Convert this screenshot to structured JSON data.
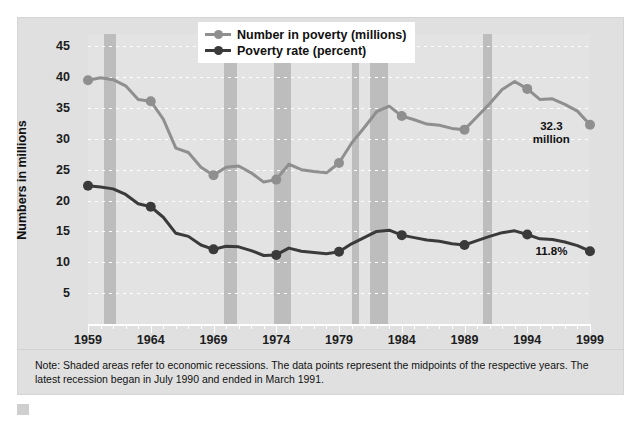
{
  "chart_data": {
    "type": "line",
    "title": "",
    "xlabel": "",
    "ylabel": "Numbers in millions",
    "xlim": [
      1959,
      1999
    ],
    "ylim": [
      0,
      47
    ],
    "yticks": [
      5,
      10,
      15,
      20,
      25,
      30,
      35,
      40,
      45
    ],
    "xticks": [
      1959,
      1964,
      1969,
      1974,
      1979,
      1984,
      1989,
      1994,
      1999
    ],
    "grid": true,
    "legend_position": "top-center",
    "x": [
      1959,
      1960,
      1961,
      1962,
      1963,
      1964,
      1965,
      1966,
      1967,
      1968,
      1969,
      1970,
      1971,
      1972,
      1973,
      1974,
      1975,
      1976,
      1977,
      1978,
      1979,
      1980,
      1981,
      1982,
      1983,
      1984,
      1985,
      1986,
      1987,
      1988,
      1989,
      1990,
      1991,
      1992,
      1993,
      1994,
      1995,
      1996,
      1997,
      1998,
      1999
    ],
    "series": [
      {
        "name": "Number in poverty (millions)",
        "color": "#8f8f8f",
        "values": [
          39.5,
          39.9,
          39.6,
          38.6,
          36.4,
          36.1,
          33.2,
          28.5,
          27.8,
          25.4,
          24.1,
          25.4,
          25.6,
          24.5,
          23.0,
          23.4,
          25.9,
          25.0,
          24.7,
          24.5,
          26.1,
          29.3,
          31.8,
          34.4,
          35.3,
          33.7,
          33.1,
          32.4,
          32.2,
          31.7,
          31.5,
          33.6,
          35.7,
          38.0,
          39.3,
          38.1,
          36.4,
          36.5,
          35.6,
          34.5,
          32.3
        ]
      },
      {
        "name": "Poverty rate (percent)",
        "color": "#3a3a3a",
        "values": [
          22.4,
          22.2,
          21.9,
          21.0,
          19.5,
          19.0,
          17.3,
          14.7,
          14.2,
          12.8,
          12.1,
          12.6,
          12.5,
          11.9,
          11.1,
          11.2,
          12.3,
          11.8,
          11.6,
          11.4,
          11.7,
          13.0,
          14.0,
          15.0,
          15.2,
          14.4,
          14.0,
          13.6,
          13.4,
          13.0,
          12.8,
          13.5,
          14.2,
          14.8,
          15.1,
          14.5,
          13.8,
          13.7,
          13.3,
          12.7,
          11.8
        ]
      }
    ],
    "annotations": [
      {
        "name": "number-in-poverty-end-label",
        "text": "32.3\nmillion",
        "x": 1997.4,
        "y": 31.0
      },
      {
        "name": "poverty-rate-end-label",
        "text": "11.8%",
        "x": 1997.2,
        "y": 11.7
      }
    ],
    "recession_bands": [
      {
        "start": 1960.3,
        "end": 1961.2
      },
      {
        "start": 1969.8,
        "end": 1970.9
      },
      {
        "start": 1973.8,
        "end": 1975.2
      },
      {
        "start": 1980.0,
        "end": 1980.6
      },
      {
        "start": 1981.5,
        "end": 1982.9
      },
      {
        "start": 1990.5,
        "end": 1991.2
      }
    ]
  },
  "legend": {
    "items": [
      {
        "label": "Number in poverty (millions)"
      },
      {
        "label": "Poverty rate (percent)"
      }
    ]
  },
  "axes": {
    "y_title": "Numbers in millions",
    "y_ticks": [
      "45",
      "40",
      "35",
      "30",
      "25",
      "20",
      "15",
      "10",
      "5"
    ],
    "x_ticks": [
      "1959",
      "1964",
      "1969",
      "1974",
      "1979",
      "1984",
      "1989",
      "1994",
      "1999"
    ]
  },
  "note": {
    "text": "Note: Shaded areas refer to economic recessions. The data points represent the midpoints of the respective years. The latest recession began in July 1990 and ended in March 1991."
  },
  "colors": {
    "panel_background": "#e0e0e0",
    "plot_background": "#e3e3e3",
    "recession_band": "#bdbdbd",
    "series_number": "#8f8f8f",
    "series_rate": "#3a3a3a",
    "gridline": "#ffffff",
    "text": "#111111"
  }
}
